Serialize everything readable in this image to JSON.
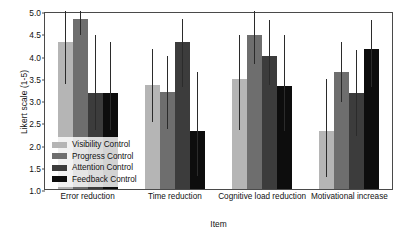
{
  "chart_data": {
    "type": "bar",
    "title": "",
    "xlabel": "Item",
    "ylabel": "Likert scale (1-5)",
    "ylim": [
      1.0,
      5.0
    ],
    "yticks": [
      1.0,
      1.5,
      2.0,
      2.5,
      3.0,
      3.5,
      4.0,
      4.5,
      5.0
    ],
    "ytick_labels": [
      "1.0",
      "1.5",
      "2.0",
      "2.5",
      "3.0",
      "3.5",
      "4.0",
      "4.5",
      "5.0"
    ],
    "grid": false,
    "legend_position": "lower left inside axes",
    "categories": [
      "Error reduction",
      "Time reduction",
      "Cognitive load reduction",
      "Motivational increase"
    ],
    "series": [
      {
        "name": "Visibility Control",
        "color": "#b5b5b5",
        "values": [
          4.31,
          3.33,
          3.47,
          2.3
        ],
        "err_low": [
          3.35,
          2.5,
          2.32,
          1.28
        ],
        "err_high": [
          5.0,
          4.15,
          4.47,
          3.47
        ]
      },
      {
        "name": "Progress Control",
        "color": "#6e6e6e",
        "values": [
          4.82,
          3.17,
          4.46,
          3.62
        ],
        "err_low": [
          4.47,
          2.35,
          3.8,
          2.95
        ],
        "err_high": [
          5.0,
          4.0,
          5.0,
          4.31
        ]
      },
      {
        "name": "Attention Control",
        "color": "#3c3c3c",
        "values": [
          3.16,
          4.31,
          3.98,
          3.15
        ],
        "err_low": [
          2.33,
          3.3,
          3.33,
          2.2
        ],
        "err_high": [
          4.47,
          4.82,
          4.8,
          4.13
        ]
      },
      {
        "name": "Feedback Control",
        "color": "#0d0d0d",
        "values": [
          3.16,
          2.31,
          3.31,
          4.14
        ],
        "err_low": [
          2.33,
          1.3,
          2.3,
          3.3
        ],
        "err_high": [
          4.31,
          3.62,
          4.47,
          4.8
        ]
      }
    ]
  }
}
